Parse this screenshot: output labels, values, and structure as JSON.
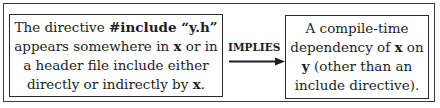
{
  "diagram": {
    "left_box": {
      "line1_prefix": "The directive ",
      "line1_code": "#include “y.h”",
      "line2_prefix": "appears somewhere in ",
      "line2_var": "x",
      "line2_suffix": " or in",
      "line3": "a header file include either",
      "line4_prefix": "directly or indirectly by ",
      "line4_var": "x",
      "line4_suffix": "."
    },
    "connector": {
      "label": "IMPLIES",
      "icon": "right-arrow-icon"
    },
    "right_box": {
      "line1": "A compile-time",
      "line2_prefix": "dependency of ",
      "line2_var": "x",
      "line2_suffix": " on",
      "line3_var": "y",
      "line3_suffix": " (other than an",
      "line4": "include directive)."
    },
    "colors": {
      "border": "#2a2a2a",
      "text": "#1e1e1e",
      "background": "#ffffff"
    }
  }
}
